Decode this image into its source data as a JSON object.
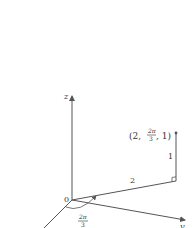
{
  "diagram": {
    "type": "cylindrical-coordinates",
    "axes": {
      "z_label": "z",
      "y_label": "y",
      "x_label": "x",
      "origin_label": "0"
    },
    "point_label": {
      "open": "(2, ",
      "frac_num": "2π",
      "frac_den": "3",
      "close": ", 1)"
    },
    "segment_labels": {
      "radius": "2",
      "height": "1"
    },
    "angle_label": {
      "num": "2π",
      "den": "3"
    },
    "colors": {
      "line": "#555555",
      "text": "#333333"
    }
  }
}
